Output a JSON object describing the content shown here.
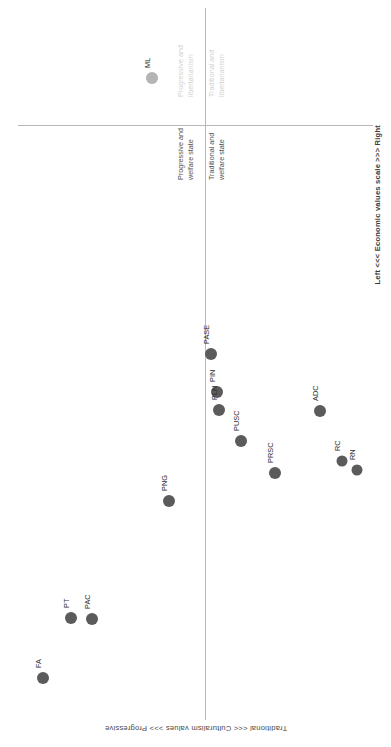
{
  "chart_data": {
    "type": "scatter",
    "title": "",
    "subtitle": "",
    "xlabel": "Traditional <<< Culturalism values >>> Progressive",
    "ylabel": "Left <<< Economic values scale >>> Right",
    "xlim": [
      -1,
      1
    ],
    "ylim": [
      -1,
      1
    ],
    "grid": false,
    "legend": "none",
    "orientation": "rotated-90",
    "axis_origin": {
      "x_px": 205,
      "y_px": 125
    },
    "quadrant_labels": [
      {
        "id": "q-progressive-libertarianism",
        "line1": "Progressive and",
        "line2": "libertarianism",
        "style": "faint",
        "color": "#d2d2d2"
      },
      {
        "id": "q-traditional-libertarianism",
        "line1": "Traditional and",
        "line2": "libertarianism",
        "style": "faint",
        "color": "#d2d2d2"
      },
      {
        "id": "q-progressive-welfare",
        "line1": "Progressive and",
        "line2": "welfare state",
        "style": "normal",
        "color": "#4f4f4f"
      },
      {
        "id": "q-traditional-welfare",
        "line1": "Traditional and",
        "line2": "welfare state",
        "style": "normal",
        "color": "#4f4f4f"
      }
    ],
    "point_style": {
      "fill_dark": "#5b5b5b",
      "fill_light": "#b4b4b4",
      "radius_px": 6
    },
    "points": [
      {
        "label": "ML",
        "px": 152,
        "py": 78,
        "cultural": 0.74,
        "economic": 0.13,
        "size": 12,
        "color": "#b4b4b4"
      },
      {
        "label": "PASE",
        "px": 211,
        "py": 354,
        "cultural": 0.15,
        "economic": -0.02,
        "size": 12,
        "color": "#5b5b5b"
      },
      {
        "label": "PIN",
        "px": 217,
        "py": 392,
        "cultural": 0.07,
        "economic": -0.03,
        "size": 12,
        "color": "#5b5b5b"
      },
      {
        "label": "PLN",
        "px": 219,
        "py": 410,
        "cultural": 0.03,
        "economic": -0.04,
        "size": 12,
        "color": "#5b5b5b"
      },
      {
        "label": "PUSC",
        "px": 241,
        "py": 441,
        "cultural": -0.04,
        "economic": -0.1,
        "size": 12,
        "color": "#5b5b5b"
      },
      {
        "label": "ADC",
        "px": 320,
        "py": 411,
        "cultural": 0.03,
        "economic": -0.32,
        "size": 12,
        "color": "#5b5b5b"
      },
      {
        "label": "PRSC",
        "px": 275,
        "py": 473,
        "cultural": -0.12,
        "economic": -0.19,
        "size": 12,
        "color": "#5b5b5b"
      },
      {
        "label": "RC",
        "px": 342,
        "py": 461,
        "cultural": -0.09,
        "economic": -0.38,
        "size": 11,
        "color": "#5b5b5b"
      },
      {
        "label": "RN",
        "px": 357,
        "py": 470,
        "cultural": -0.11,
        "economic": -0.43,
        "size": 11,
        "color": "#5b5b5b"
      },
      {
        "label": "PNG",
        "px": 169,
        "py": 501,
        "cultural": -0.19,
        "economic": 0.1,
        "size": 12,
        "color": "#5b5b5b"
      },
      {
        "label": "PT",
        "px": 71,
        "py": 618,
        "cultural": -0.49,
        "economic": 0.38,
        "size": 12,
        "color": "#5b5b5b"
      },
      {
        "label": "PAC",
        "px": 92,
        "py": 619,
        "cultural": -0.49,
        "economic": 0.32,
        "size": 12,
        "color": "#5b5b5b"
      },
      {
        "label": "FA",
        "px": 43,
        "py": 678,
        "cultural": -0.65,
        "economic": 0.46,
        "size": 12,
        "color": "#5b5b5b"
      }
    ]
  },
  "axes": {
    "x_label": "Traditional <<< Culturalism values >>> Progressive",
    "y_label": "Left <<< Economic values scale >>> Right",
    "line_color": "#b7b7b7"
  }
}
